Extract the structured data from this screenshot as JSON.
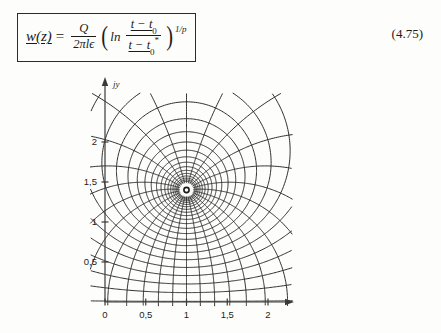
{
  "equation": {
    "id": "4.75",
    "lhs": "w(z)",
    "equals": "=",
    "prefactor_numerator": "Q",
    "prefactor_denominator": "2πlϵ",
    "ln": "ln",
    "arg_numerator": "t − t",
    "arg_numerator_sub": "0",
    "arg_denominator": "t − t",
    "arg_denominator_sub": "0",
    "arg_denominator_star": "*",
    "exponent": "1/p",
    "paren_open": "(",
    "paren_close": ")"
  },
  "figure": {
    "y_axis_name": "jy",
    "x_axis_name": "",
    "x_ticks": [
      "0",
      "0,5",
      "1",
      "1,5",
      "2"
    ],
    "x_tick_values": [
      0,
      0.5,
      1,
      1.5,
      2
    ],
    "y_ticks": [
      "0,5",
      "1",
      "1,5",
      "2"
    ],
    "y_tick_values": [
      0.5,
      1,
      1.5,
      2
    ],
    "singularity": {
      "x": 1.0,
      "y": 1.4
    },
    "line_color": "#232323",
    "axis_color": "#3a3a3a"
  },
  "chart_data": {
    "type": "line",
    "title": "",
    "xlabel": "",
    "ylabel": "jy",
    "xlim": [
      -0.15,
      2.25
    ],
    "ylim": [
      -0.1,
      2.45
    ],
    "grid": false,
    "legend": null,
    "x_tick_labels": [
      "0",
      "0,5",
      "1",
      "1,5",
      "2"
    ],
    "y_tick_labels": [
      "0,5",
      "1",
      "1,5",
      "2"
    ],
    "singularity_point": [
      1.0,
      1.4
    ],
    "annotations": [],
    "series": [
      {
        "name": "equipotential-loops",
        "kind": "closed-contour",
        "count": 22
      },
      {
        "name": "flux-lines",
        "kind": "radial-curve",
        "count": 26
      }
    ]
  }
}
